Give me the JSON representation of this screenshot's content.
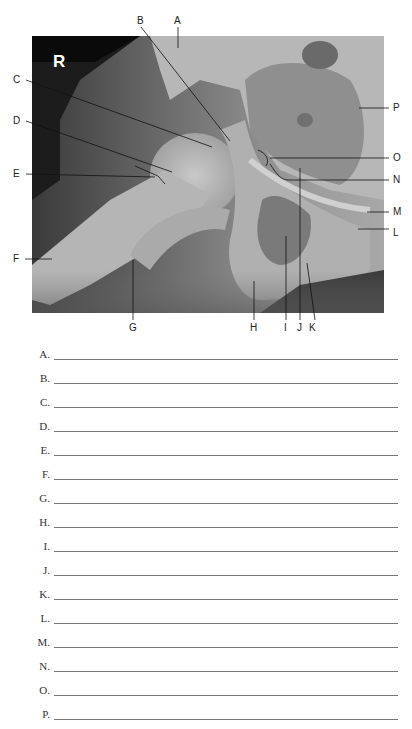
{
  "figure": {
    "side_marker": "R",
    "labels": {
      "A": "A",
      "B": "B",
      "C": "C",
      "D": "D",
      "E": "E",
      "F": "F",
      "G": "G",
      "H": "H",
      "I": "I",
      "J": "J",
      "K": "K",
      "L": "L",
      "M": "M",
      "N": "N",
      "O": "O",
      "P": "P"
    }
  },
  "answers": [
    {
      "letter": "A.",
      "value": ""
    },
    {
      "letter": "B.",
      "value": ""
    },
    {
      "letter": "C.",
      "value": ""
    },
    {
      "letter": "D.",
      "value": ""
    },
    {
      "letter": "E.",
      "value": ""
    },
    {
      "letter": "F.",
      "value": ""
    },
    {
      "letter": "G.",
      "value": ""
    },
    {
      "letter": "H.",
      "value": ""
    },
    {
      "letter": "I.",
      "value": ""
    },
    {
      "letter": "J.",
      "value": ""
    },
    {
      "letter": "K.",
      "value": ""
    },
    {
      "letter": "L.",
      "value": ""
    },
    {
      "letter": "M.",
      "value": ""
    },
    {
      "letter": "N.",
      "value": ""
    },
    {
      "letter": "O.",
      "value": ""
    },
    {
      "letter": "P.",
      "value": ""
    }
  ]
}
